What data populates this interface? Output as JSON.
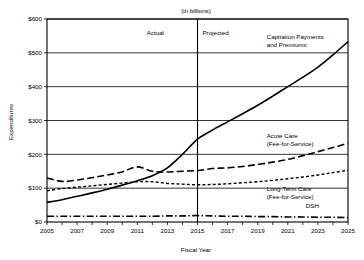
{
  "chart_data": {
    "type": "line",
    "title": "(in billions)",
    "xlabel": "Fiscal Year",
    "ylabel": "Expenditures",
    "xlim": [
      2005,
      2025
    ],
    "ylim": [
      0,
      600
    ],
    "grid": true,
    "legend_position": "inline-annotations",
    "x": [
      2005,
      2006,
      2007,
      2008,
      2009,
      2010,
      2011,
      2012,
      2013,
      2014,
      2015,
      2016,
      2017,
      2018,
      2019,
      2020,
      2021,
      2022,
      2023,
      2024,
      2025
    ],
    "xtick_labels": [
      "2005",
      "2007",
      "2009",
      "2011",
      "2013",
      "2015",
      "2017",
      "2019",
      "2021",
      "2023",
      "2025"
    ],
    "xtick_values": [
      2005,
      2007,
      2009,
      2011,
      2013,
      2015,
      2017,
      2019,
      2021,
      2023,
      2025
    ],
    "ytick_labels": [
      "$0",
      "$100",
      "$200",
      "$300",
      "$400",
      "$500",
      "$600"
    ],
    "ytick_values": [
      0,
      100,
      200,
      300,
      400,
      500,
      600
    ],
    "annotations": [
      {
        "name": "actual-label",
        "text": "Actual",
        "x": 2012.2,
        "y": 552
      },
      {
        "name": "projected-label",
        "text": "Projected",
        "x": 2016.2,
        "y": 552
      },
      {
        "name": "divider",
        "text": "",
        "x": 2015,
        "y": 600
      }
    ],
    "divider_x": 2015,
    "series": [
      {
        "name": "Capitation Payments and Premiums",
        "label_lines": [
          "Capitation Payments",
          "and Premiums"
        ],
        "dash": "solid",
        "width": 1.6,
        "label_x": 2019.6,
        "label_y": 540,
        "values": [
          58,
          66,
          76,
          86,
          97,
          109,
          122,
          137,
          160,
          200,
          245,
          272,
          296,
          320,
          345,
          372,
          400,
          428,
          458,
          494,
          533
        ]
      },
      {
        "name": "Acute Care (Fee-for-Service)",
        "label_lines": [
          "Acute Care",
          "(Fee-for-Service)"
        ],
        "dash": "long-dash",
        "width": 1.6,
        "label_x": 2019.6,
        "label_y": 248,
        "values": [
          130,
          120,
          124,
          131,
          139,
          148,
          163,
          150,
          148,
          150,
          152,
          158,
          160,
          164,
          170,
          177,
          185,
          196,
          208,
          220,
          233
        ]
      },
      {
        "name": "Long-Term Care (Fee-for-Service)",
        "label_lines": [
          "Long-Term Care",
          "(Fee-for-Service)"
        ],
        "dash": "short-dash",
        "width": 1.4,
        "label_x": 2019.6,
        "label_y": 92,
        "values": [
          92,
          99,
          103,
          107,
          111,
          115,
          119,
          119,
          114,
          112,
          110,
          111,
          113,
          116,
          119,
          123,
          128,
          133,
          139,
          146,
          153
        ]
      },
      {
        "name": "DSH",
        "label_lines": [
          "DSH"
        ],
        "dash": "dash-dot",
        "width": 1.6,
        "label_x": 2022.2,
        "label_y": 42,
        "values": [
          17,
          17,
          17,
          17,
          17,
          17,
          17,
          17,
          18,
          18,
          19,
          18,
          17,
          17,
          16,
          16,
          15,
          15,
          14,
          14,
          13
        ]
      }
    ]
  }
}
